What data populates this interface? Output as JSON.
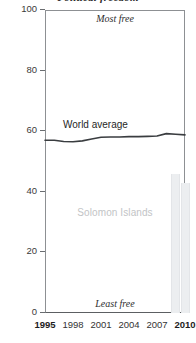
{
  "chart_data": {
    "type": "line",
    "title": "Political freedom",
    "subtitle_cut_off": true,
    "xlabel": "",
    "ylabel": "",
    "xlim": [
      1995,
      2010
    ],
    "ylim": [
      0,
      100
    ],
    "grid": false,
    "legend_position": "inline-labels",
    "x_ticks": [
      {
        "value": 1995,
        "label": "1995",
        "emphasis": true
      },
      {
        "value": 1998,
        "label": "1998",
        "emphasis": false
      },
      {
        "value": 2001,
        "label": "2001",
        "emphasis": false
      },
      {
        "value": 2004,
        "label": "2004",
        "emphasis": false
      },
      {
        "value": 2007,
        "label": "2007",
        "emphasis": false
      },
      {
        "value": 2010,
        "label": "2010",
        "emphasis": true
      }
    ],
    "y_ticks": [
      {
        "value": 0,
        "label": "0"
      },
      {
        "value": 20,
        "label": "20"
      },
      {
        "value": 40,
        "label": "40"
      },
      {
        "value": 60,
        "label": "60"
      },
      {
        "value": 80,
        "label": "80"
      },
      {
        "value": 100,
        "label": "100"
      }
    ],
    "annotations": [
      {
        "id": "most-free",
        "text": "Most free",
        "position": "top-center"
      },
      {
        "id": "least-free",
        "text": "Least free",
        "position": "bottom-center"
      },
      {
        "id": "world-average",
        "text": "World average",
        "position": "inline-line-label"
      },
      {
        "id": "solomon-islands",
        "text": "Solomon Islands",
        "position": "plot-center-watermark"
      }
    ],
    "series": [
      {
        "name": "World average",
        "render": "line",
        "color": "#3a3d40",
        "x": [
          1995,
          1996,
          1997,
          1998,
          1999,
          2000,
          2001,
          2002,
          2003,
          2004,
          2005,
          2006,
          2007,
          2008,
          2009,
          2010
        ],
        "values": [
          57,
          57,
          56.6,
          56.5,
          56.8,
          57.4,
          58,
          58.1,
          58.1,
          58.2,
          58.2,
          58.3,
          58.4,
          59.2,
          59,
          58.8
        ]
      },
      {
        "name": "Solomon Islands",
        "render": "bar",
        "color": "#eceef0",
        "x": [
          2009,
          2010
        ],
        "values": [
          46,
          43
        ]
      }
    ]
  },
  "axis_titles": {
    "most_free": "Most free",
    "least_free": "Least free"
  }
}
